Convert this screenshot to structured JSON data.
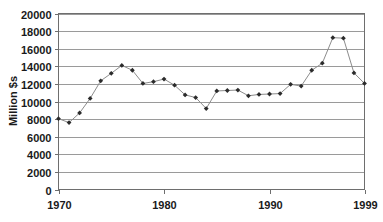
{
  "chart_data": {
    "type": "line",
    "title": "",
    "xlabel": "",
    "ylabel": "Million $s",
    "xlim": [
      1970,
      1999
    ],
    "ylim": [
      0,
      20000
    ],
    "grid": "horizontal",
    "legend": "none",
    "marker": "diamond",
    "line_color": "#8c8c8c",
    "marker_color": "#2b2b2b",
    "grid_color": "#9a9a9a",
    "axis_color": "#6e6e6e",
    "x": [
      1970,
      1971,
      1972,
      1973,
      1974,
      1975,
      1976,
      1977,
      1978,
      1979,
      1980,
      1981,
      1982,
      1983,
      1984,
      1985,
      1986,
      1987,
      1988,
      1989,
      1990,
      1991,
      1992,
      1993,
      1994,
      1995,
      1996,
      1997,
      1998,
      1999
    ],
    "values": [
      8050,
      7600,
      8700,
      10350,
      12350,
      13200,
      14100,
      13550,
      12050,
      12250,
      12550,
      11850,
      10750,
      10450,
      9200,
      11200,
      11250,
      11300,
      10650,
      10800,
      10850,
      10900,
      11950,
      11750,
      13550,
      14350,
      17250,
      17200,
      13250,
      12050
    ],
    "xticks": [
      1970,
      1980,
      1990,
      1999
    ],
    "xticklabels": [
      "1970",
      "1980",
      "1990",
      "1999"
    ],
    "yticks": [
      0,
      2000,
      4000,
      6000,
      8000,
      10000,
      12000,
      14000,
      16000,
      18000,
      20000
    ],
    "yticklabels": [
      "0",
      "2000",
      "4000",
      "6000",
      "8000",
      "10000",
      "12000",
      "14000",
      "16000",
      "18000",
      "20000"
    ]
  }
}
